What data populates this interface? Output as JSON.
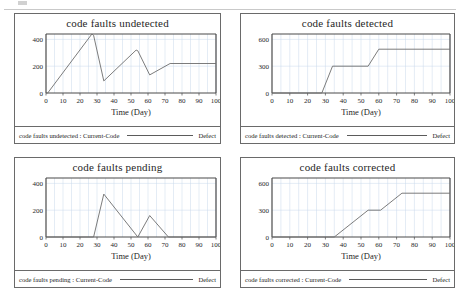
{
  "page": {
    "background": "#ffffff",
    "axis_color": "#4a4a4a",
    "grid_color": "#c8d8ea",
    "series_color": "#6d6d6d",
    "panel_border": "#6a6a6a"
  },
  "charts": [
    {
      "title": "code faults undetected",
      "legend_name": "code faults undetected : Current-Code",
      "legend_tag": "Defect",
      "xlabel": "Time (Day)",
      "xticks": [
        "0",
        "10",
        "20",
        "30",
        "40",
        "50",
        "60",
        "70",
        "80",
        "90",
        "100"
      ],
      "yticks": [
        "0",
        "200",
        "400"
      ],
      "chart_data": {
        "type": "line",
        "title": "code faults undetected",
        "xlabel": "Time (Day)",
        "ylabel": "",
        "xlim": [
          0,
          100
        ],
        "ylim": [
          0,
          440
        ],
        "ytick_values": [
          0,
          200,
          400
        ],
        "xtick_values": [
          0,
          10,
          20,
          30,
          40,
          50,
          60,
          70,
          80,
          90,
          100
        ],
        "grid": true,
        "legend": "code faults undetected : Current-Code",
        "legend_position": "bottom",
        "series": [
          {
            "name": "code faults undetected : Current-Code",
            "color": "#6d6d6d",
            "x": [
              0,
              1,
              27,
              28,
              34,
              53,
              54,
              61,
              73,
              100
            ],
            "y": [
              0,
              0,
              440,
              430,
              90,
              320,
              315,
              135,
              220,
              220
            ]
          }
        ]
      }
    },
    {
      "title": "code faults detected",
      "legend_name": "code faults detected : Current-Code",
      "legend_tag": "Defect",
      "xlabel": "Time (Day)",
      "xticks": [
        "0",
        "10",
        "20",
        "30",
        "40",
        "50",
        "60",
        "70",
        "80",
        "90",
        "100"
      ],
      "yticks": [
        "0",
        "300",
        "600"
      ],
      "chart_data": {
        "type": "line",
        "title": "code faults detected",
        "xlabel": "Time (Day)",
        "ylabel": "",
        "xlim": [
          0,
          100
        ],
        "ylim": [
          0,
          660
        ],
        "ytick_values": [
          0,
          300,
          600
        ],
        "xtick_values": [
          0,
          10,
          20,
          30,
          40,
          50,
          60,
          70,
          80,
          90,
          100
        ],
        "grid": true,
        "legend": "code faults detected : Current-Code",
        "legend_position": "bottom",
        "series": [
          {
            "name": "code faults detected : Current-Code",
            "color": "#6d6d6d",
            "x": [
              0,
              28,
              34,
              54,
              60,
              100
            ],
            "y": [
              0,
              0,
              300,
              300,
              490,
              490
            ]
          }
        ]
      }
    },
    {
      "title": "code faults pending",
      "legend_name": "code faults pending : Current-Code",
      "legend_tag": "Defect",
      "xlabel": "Time (Day)",
      "xticks": [
        "0",
        "10",
        "20",
        "30",
        "40",
        "50",
        "60",
        "70",
        "80",
        "90",
        "100"
      ],
      "yticks": [
        "0",
        "200",
        "400"
      ],
      "chart_data": {
        "type": "line",
        "title": "code faults pending",
        "xlabel": "Time (Day)",
        "ylabel": "",
        "xlim": [
          0,
          100
        ],
        "ylim": [
          0,
          440
        ],
        "ytick_values": [
          0,
          200,
          400
        ],
        "xtick_values": [
          0,
          10,
          20,
          30,
          40,
          50,
          60,
          70,
          80,
          90,
          100
        ],
        "grid": true,
        "legend": "code faults pending : Current-Code",
        "legend_position": "bottom",
        "series": [
          {
            "name": "code faults pending : Current-Code",
            "color": "#6d6d6d",
            "x": [
              0,
              28,
              34,
              54,
              61,
              72,
              100
            ],
            "y": [
              0,
              0,
              320,
              0,
              160,
              0,
              0
            ]
          }
        ]
      }
    },
    {
      "title": "code faults corrected",
      "legend_name": "code faults corrected : Current-Code",
      "legend_tag": "Defect",
      "xlabel": "Time (Day)",
      "xticks": [
        "0",
        "10",
        "20",
        "30",
        "40",
        "50",
        "60",
        "70",
        "80",
        "90",
        "100"
      ],
      "yticks": [
        "0",
        "300",
        "600"
      ],
      "chart_data": {
        "type": "line",
        "title": "code faults corrected",
        "xlabel": "Time (Day)",
        "ylabel": "",
        "xlim": [
          0,
          100
        ],
        "ylim": [
          0,
          660
        ],
        "ytick_values": [
          0,
          300,
          600
        ],
        "xtick_values": [
          0,
          10,
          20,
          30,
          40,
          50,
          60,
          70,
          80,
          90,
          100
        ],
        "grid": true,
        "legend": "code faults corrected : Current-Code",
        "legend_position": "bottom",
        "series": [
          {
            "name": "code faults corrected : Current-Code",
            "color": "#6d6d6d",
            "x": [
              0,
              35,
              54,
              61,
              73,
              100
            ],
            "y": [
              0,
              0,
              300,
              300,
              490,
              490
            ]
          }
        ]
      }
    }
  ]
}
